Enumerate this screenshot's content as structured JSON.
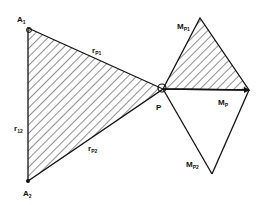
{
  "diagram": {
    "colors": {
      "stroke": "#111111",
      "hatch": "#222222",
      "background": "#ffffff"
    },
    "points": {
      "A1": {
        "x": 28,
        "y": 28
      },
      "A2": {
        "x": 28,
        "y": 181
      },
      "P": {
        "x": 163,
        "y": 89
      },
      "MP1": {
        "x": 200,
        "y": 18
      },
      "MP": {
        "x": 249,
        "y": 90
      },
      "MP2": {
        "x": 212,
        "y": 174
      }
    },
    "labels": {
      "A1": {
        "main": "A",
        "sub": "1"
      },
      "A2": {
        "main": "A",
        "sub": "2"
      },
      "P": {
        "main": "P"
      },
      "rP1": {
        "main": "r",
        "sub": "P1"
      },
      "rP2": {
        "main": "r",
        "sub": "P2"
      },
      "r12": {
        "main": "r",
        "sub": "12"
      },
      "MP1": {
        "main": "M",
        "sub": "P1"
      },
      "MP": {
        "main": "M",
        "sub": "P"
      },
      "MP2": {
        "main": "M",
        "sub": "P2"
      }
    },
    "regions": {
      "left_triangle": "A1-P-A2 (hatched)",
      "right_triangle_top": "P-MP1-MP (hatched)",
      "right_triangle_bottom": "P-MP-MP2 (unhatched)"
    }
  }
}
